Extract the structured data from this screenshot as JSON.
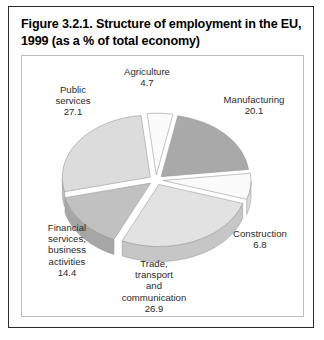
{
  "figure": {
    "title": "Figure 3.2.1. Structure of employment in the EU, 1999 (as a % of total economy)"
  },
  "labels": {
    "agriculture": "Agriculture\n4.7",
    "manufacturing": "Manufacturing\n20.1",
    "public_services": "Public\nservices\n27.1",
    "financial": "Financial\nservices,\nbusiness\nactivities\n14.4",
    "construction": "Construction\n6.8",
    "trade": "Trade,\ntransport\nand\ncommunication\n26.9"
  },
  "chart_data": {
    "type": "pie",
    "title": "Figure 3.2.1. Structure of employment in the EU, 1999 (as a % of total economy)",
    "unit": "% of total economy",
    "exploded": true,
    "three_d": true,
    "legend": "none",
    "total": 100.0,
    "categories": [
      "Agriculture",
      "Manufacturing",
      "Construction",
      "Trade, transport and communication",
      "Financial services, business activities",
      "Public services"
    ],
    "values": [
      4.7,
      20.1,
      6.8,
      26.9,
      14.4,
      27.1
    ],
    "slices": [
      {
        "label": "Agriculture",
        "value": 4.7,
        "color": "#fbfbfb",
        "side_color": "#e3e3e3",
        "start_angle": 0.0,
        "end_angle": 16.92
      },
      {
        "label": "Manufacturing",
        "value": 20.1,
        "color": "#a9a9a9",
        "side_color": "#8e8e8e",
        "start_angle": 16.92,
        "end_angle": 89.28
      },
      {
        "label": "Construction",
        "value": 6.8,
        "color": "#fafafa",
        "side_color": "#dcdcdc",
        "start_angle": 89.28,
        "end_angle": 113.76
      },
      {
        "label": "Trade, transport and communication",
        "value": 26.9,
        "color": "#e2e2e2",
        "side_color": "#c6c6c6",
        "start_angle": 113.76,
        "end_angle": 210.6
      },
      {
        "label": "Financial services, business activities",
        "value": 14.4,
        "color": "#c1c1c1",
        "side_color": "#a6a6a6",
        "start_angle": 210.6,
        "end_angle": 262.44
      },
      {
        "label": "Public services",
        "value": 27.1,
        "color": "#dcdcdc",
        "side_color": "#bfbfbf",
        "start_angle": 262.44,
        "end_angle": 360.0
      }
    ]
  }
}
